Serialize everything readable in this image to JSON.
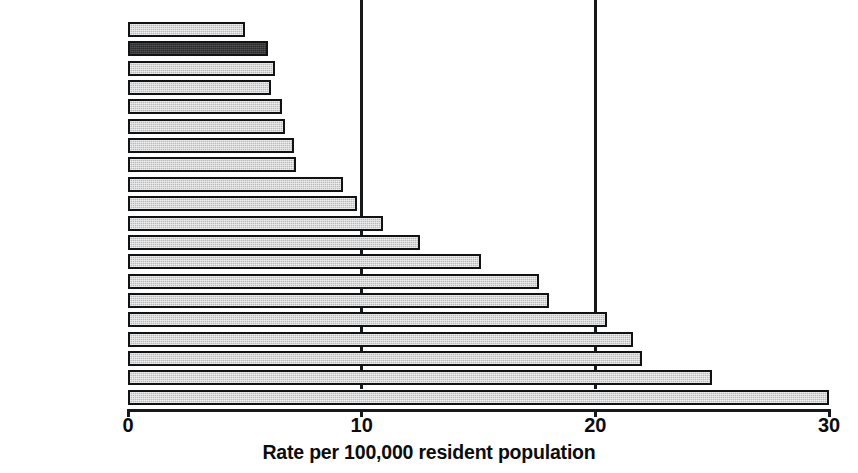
{
  "chart_data": {
    "type": "bar",
    "orientation": "horizontal",
    "title": "",
    "subtitle": "",
    "xlabel": "Rate per 100,000 resident population",
    "ylabel": "",
    "xlim": [
      0,
      30
    ],
    "xticks": [
      0,
      10,
      20,
      30
    ],
    "xtick_labels": [
      "0",
      "10",
      "20",
      "30"
    ],
    "grid": "vertical gridlines at 10 and 20",
    "legend": "none",
    "categories": [
      "Sweden",
      "UK",
      "Finland",
      "Netherlands",
      "Croatia",
      "Czech Rep.",
      "Denmark",
      "Israel",
      "Germany",
      "Austria",
      "Luxembourg",
      "Hungary",
      "Poland",
      "Belarus",
      "Greece",
      "Portugal",
      "Greece",
      "Russia",
      "Estonia",
      "Latvia"
    ],
    "values": [
      5.0,
      6.0,
      6.3,
      6.1,
      6.6,
      6.7,
      7.1,
      7.2,
      9.2,
      9.8,
      10.9,
      12.5,
      15.1,
      17.6,
      18.0,
      20.5,
      21.6,
      22.0,
      25.0,
      30.0
    ],
    "highlight_category": "UK",
    "colors": {
      "bar_fill": "#b9b9b9",
      "bar_border": "#111214",
      "highlight_fill": "#2b2b2d",
      "axis": "#17181a",
      "text": "#0b0c0d",
      "background": "#ffffff"
    }
  }
}
